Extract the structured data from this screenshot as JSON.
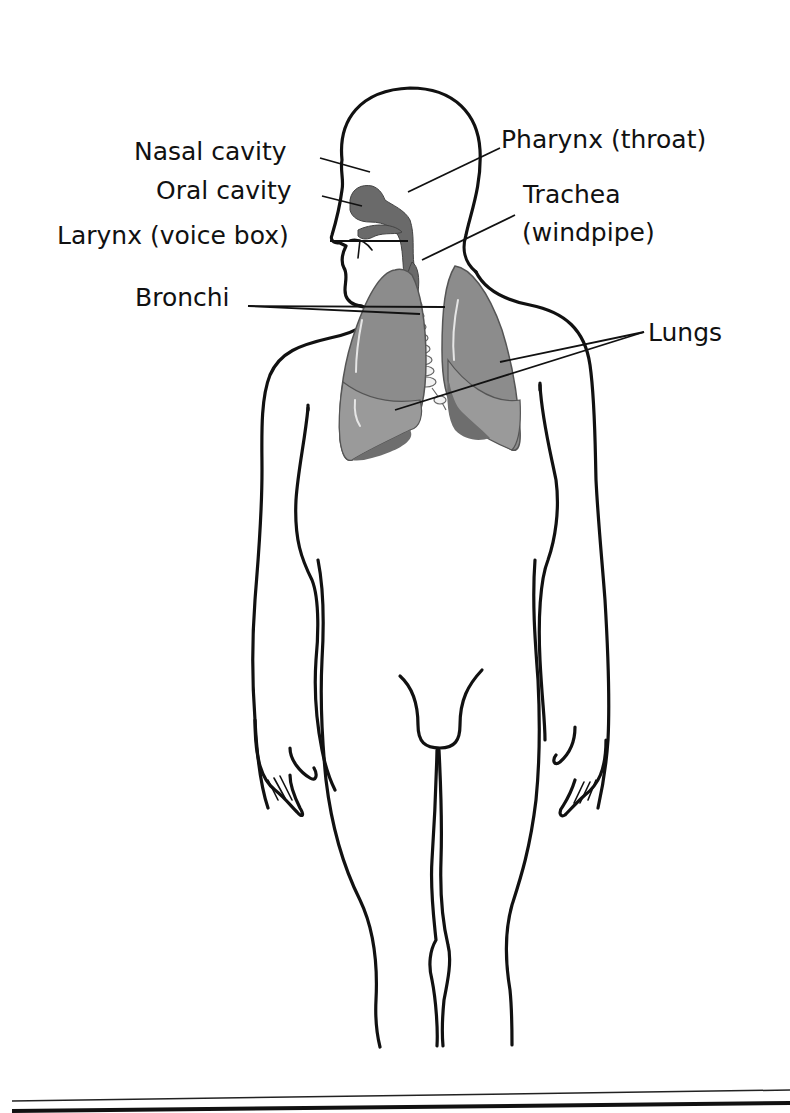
{
  "diagram": {
    "labels": {
      "nasal_cavity": "Nasal cavity",
      "oral_cavity": "Oral cavity",
      "larynx": "Larynx (voice box)",
      "pharynx": "Pharynx (throat)",
      "trachea_line1": "Trachea",
      "trachea_line2": "(windpipe)",
      "bronchi": "Bronchi",
      "lungs": "Lungs"
    },
    "colors": {
      "outline": "#111111",
      "organ_fill": "#8c8c8c",
      "organ_dark": "#6a6a6a",
      "background": "#ffffff"
    }
  }
}
